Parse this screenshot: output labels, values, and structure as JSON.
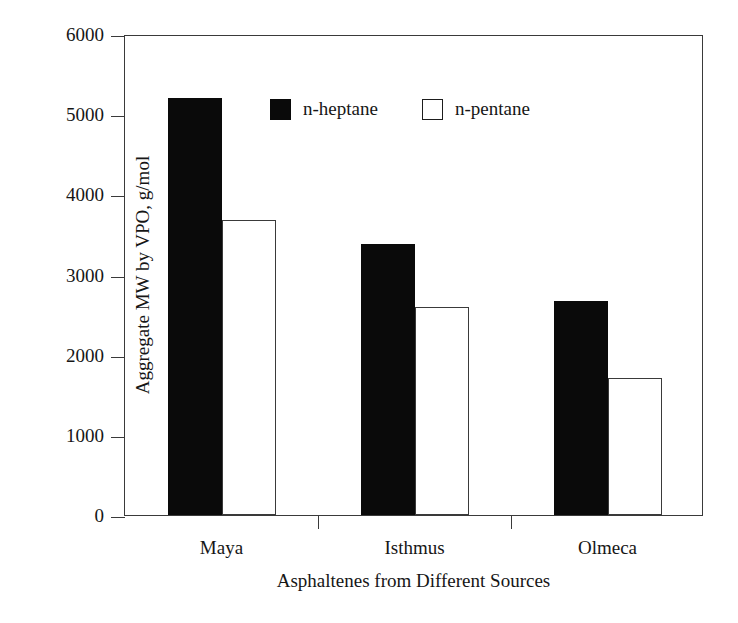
{
  "chart_data": {
    "type": "bar",
    "title": "",
    "xlabel": "Asphaltenes from Different Sources",
    "ylabel": "Aggregate MW by VPO, g/mol",
    "categories": [
      "Maya",
      "Isthmus",
      "Olmeca"
    ],
    "series": [
      {
        "name": "n-heptane",
        "values": [
          5200,
          3380,
          2670
        ],
        "color": "#0a0a0a",
        "fill": "solid"
      },
      {
        "name": "n-pentane",
        "values": [
          3680,
          2600,
          1710
        ],
        "color": "#ffffff",
        "fill": "hollow"
      }
    ],
    "ylim": [
      0,
      6000
    ],
    "yticks": [
      0,
      1000,
      2000,
      3000,
      4000,
      5000,
      6000
    ],
    "ytick_labels": [
      "0",
      "1000",
      "2000",
      "3000",
      "4000",
      "5000",
      "6000"
    ],
    "grid": false,
    "legend_position": "top-center-left",
    "frame": true
  },
  "axes": {
    "y_title": "Aggregate MW by VPO, g/mol",
    "x_title": "Asphaltenes from Different Sources"
  },
  "legend": {
    "entries": [
      {
        "label": "n-heptane",
        "swatch": "filled-square-icon"
      },
      {
        "label": "n-pentane",
        "swatch": "hollow-square-icon"
      }
    ]
  }
}
